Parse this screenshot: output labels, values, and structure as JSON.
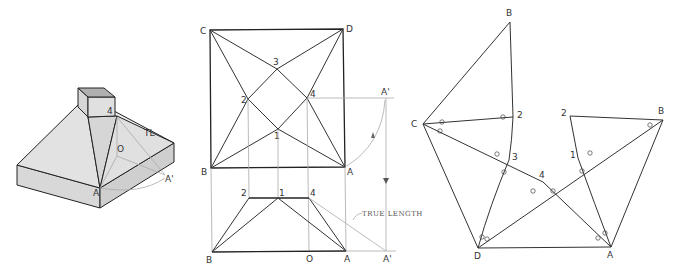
{
  "figure": {
    "colors": {
      "line": "#222222",
      "construction": "#aaaaaa",
      "face_light": "#e4e4e4",
      "face_mid": "#d8d8d8",
      "face_dark": "#c8c8c8",
      "opening": "#b0b0b0"
    }
  },
  "pictorial": {
    "labels": {
      "corner_a": "A",
      "point_4": "4",
      "point_o": "O",
      "point_a_prime": "A'",
      "true_length": "TL"
    }
  },
  "plan_view": {
    "labels": {
      "c": "C",
      "d": "D",
      "b": "B",
      "a": "A",
      "p1": "1",
      "p2": "2",
      "p3": "3",
      "p4": "4",
      "a_prime": "A'"
    }
  },
  "elevation_view": {
    "labels": {
      "b": "B",
      "a": "A",
      "a_prime": "A'",
      "o": "O",
      "p1": "1",
      "p2": "2",
      "p4": "4"
    },
    "annotation": "TRUE LENGTH"
  },
  "pattern": {
    "labels": {
      "b_top": "B",
      "c": "C",
      "p2_left": "2",
      "p3": "3",
      "p4": "4",
      "d": "D",
      "a": "A",
      "p2_right": "2",
      "b_right": "B",
      "p1": "1"
    }
  }
}
